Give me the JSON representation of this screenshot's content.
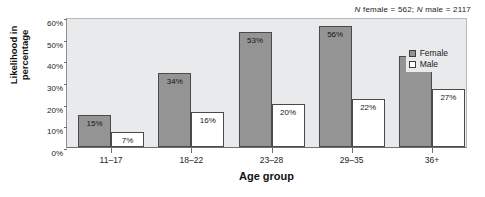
{
  "annotation": {
    "n_female_label": "N female = 562",
    "n_male_label": "N male = 2117",
    "separator": "; ",
    "n_italic": "N",
    "n_female_text": " female = 562; ",
    "n_male_text": " male = 2117"
  },
  "legend": {
    "position": "top-right",
    "items": [
      {
        "label": "Female",
        "color": "#949494",
        "swatch": "filled-gray-square"
      },
      {
        "label": "Male",
        "color": "#ffffff",
        "swatch": "empty-white-square"
      }
    ]
  },
  "axes": {
    "ylabel_line1": "Likelihood in",
    "ylabel_line2": "percentage",
    "xlabel": "Age group",
    "yticks": [
      "0%",
      "10%",
      "20%",
      "30%",
      "40%",
      "50%",
      "60%"
    ]
  },
  "chart_data": {
    "type": "bar",
    "title": "",
    "subtitle": "",
    "xlabel": "Age group",
    "ylabel": "Likelihood in percentage",
    "categories": [
      "11–17",
      "18–22",
      "23–28",
      "29–35",
      "36+"
    ],
    "series": [
      {
        "name": "Female",
        "color": "#949494",
        "values": [
          15,
          34,
          53,
          56,
          42
        ],
        "labels": [
          "15%",
          "34%",
          "53%",
          "56%",
          "42%"
        ]
      },
      {
        "name": "Male",
        "color": "#ffffff",
        "values": [
          7,
          16,
          20,
          22,
          27
        ],
        "labels": [
          "7%",
          "16%",
          "20%",
          "22%",
          "27%"
        ]
      }
    ],
    "ylim": [
      0,
      60
    ],
    "ytick_values": [
      0,
      10,
      20,
      30,
      40,
      50,
      60
    ],
    "ytick_labels": [
      "0%",
      "10%",
      "20%",
      "30%",
      "40%",
      "50%",
      "60%"
    ],
    "grid": false,
    "legend_position": "top-right",
    "annotations": [
      "N female = 562; N male = 2117"
    ],
    "sample_sizes": {
      "female": 562,
      "male": 2117
    }
  }
}
